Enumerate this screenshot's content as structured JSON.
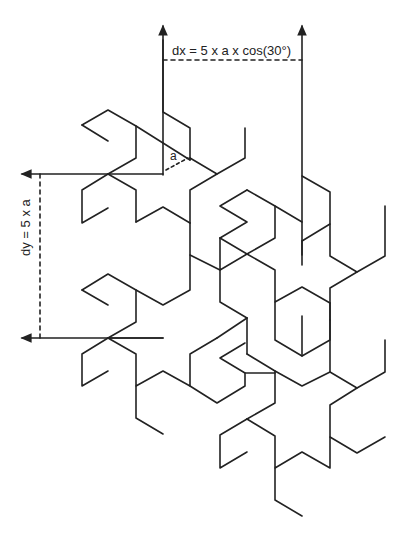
{
  "diagram": {
    "type": "tessellation-dimension-diagram",
    "labels": {
      "dx": "dx = 5 x a x cos(30°)",
      "dy": "dy = 5 x a",
      "a": "a"
    },
    "colors": {
      "stroke": "#222222",
      "background": "#ffffff"
    }
  }
}
